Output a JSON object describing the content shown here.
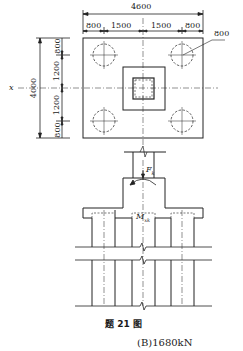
{
  "figure": {
    "caption": "题 21 图",
    "answer_option": "(B)1680kN"
  },
  "plan_view": {
    "overall_width": "4600",
    "width_segments": [
      "800",
      "1500",
      "1500",
      "800"
    ],
    "overall_height": "4000",
    "height_segments": [
      "800",
      "1200",
      "1200",
      "800"
    ],
    "pile_diameter_label": "800",
    "axis_label": "x"
  },
  "section_view": {
    "force_label": "F",
    "force_subscript": "k",
    "moment_label": "M",
    "moment_subscript": "xk"
  }
}
